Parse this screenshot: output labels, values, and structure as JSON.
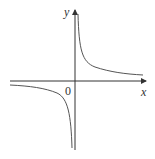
{
  "diagram": {
    "type": "function-graph",
    "function": "y = 1/x",
    "axis_labels": {
      "x": "x",
      "y": "y",
      "origin": "0"
    },
    "colors": {
      "axis": "#333333",
      "curve": "#555555",
      "background": "#ffffff"
    }
  }
}
